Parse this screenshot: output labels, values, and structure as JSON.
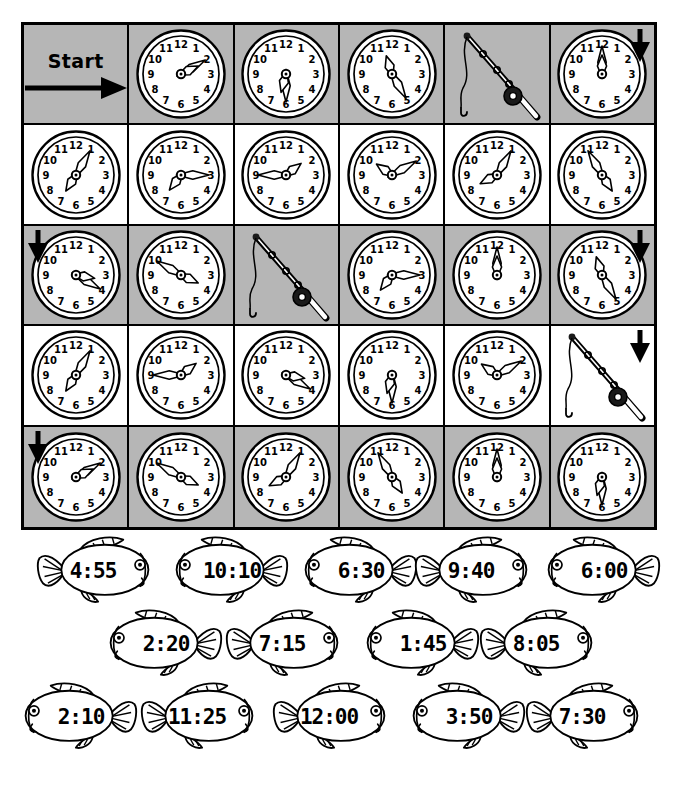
{
  "worksheet": {
    "type": "telling-time maze worksheet",
    "start_label": "Start",
    "grid": {
      "rows": 5,
      "columns": 6,
      "shaded_rows": [
        1,
        3,
        5
      ],
      "cells": [
        [
          {
            "kind": "start",
            "label": "Start",
            "arrow": "right"
          },
          {
            "kind": "clock",
            "time": "2:10",
            "hour": 2,
            "minute": 10
          },
          {
            "kind": "clock",
            "time": "6:30",
            "hour": 6,
            "minute": 30
          },
          {
            "kind": "clock",
            "time": "11:25",
            "hour": 11,
            "minute": 25
          },
          {
            "kind": "rod",
            "label": "fishing-rod"
          },
          {
            "kind": "clock",
            "time": "12:00",
            "hour": 12,
            "minute": 0,
            "arrow": "down-right"
          }
        ],
        [
          {
            "kind": "clock",
            "time": "7:05",
            "hour": 7,
            "minute": 5
          },
          {
            "kind": "clock",
            "time": "7:15",
            "hour": 7,
            "minute": 15
          },
          {
            "kind": "clock",
            "time": "1:45",
            "hour": 1,
            "minute": 45
          },
          {
            "kind": "clock",
            "time": "10:10",
            "hour": 10,
            "minute": 10
          },
          {
            "kind": "clock",
            "time": "8:05",
            "hour": 8,
            "minute": 5
          },
          {
            "kind": "clock",
            "time": "4:55",
            "hour": 4,
            "minute": 55
          }
        ],
        [
          {
            "kind": "clock",
            "time": "3:20",
            "hour": 3,
            "minute": 20,
            "arrow": "down-left"
          },
          {
            "kind": "clock",
            "time": "3:50",
            "hour": 3,
            "minute": 50
          },
          {
            "kind": "rod",
            "label": "fishing-rod"
          },
          {
            "kind": "clock",
            "time": "7:15",
            "hour": 7,
            "minute": 15
          },
          {
            "kind": "clock",
            "time": "12:00",
            "hour": 12,
            "minute": 0
          },
          {
            "kind": "clock",
            "time": "11:25",
            "hour": 11,
            "minute": 25,
            "arrow": "down-right"
          }
        ],
        [
          {
            "kind": "clock",
            "time": "7:05",
            "hour": 7,
            "minute": 5
          },
          {
            "kind": "clock",
            "time": "1:45",
            "hour": 1,
            "minute": 45
          },
          {
            "kind": "clock",
            "time": "3:20",
            "hour": 3,
            "minute": 20
          },
          {
            "kind": "clock",
            "time": "6:30",
            "hour": 6,
            "minute": 30
          },
          {
            "kind": "clock",
            "time": "10:10",
            "hour": 10,
            "minute": 10
          },
          {
            "kind": "rod",
            "label": "fishing-rod",
            "arrow": "down-right"
          }
        ],
        [
          {
            "kind": "clock",
            "time": "2:10",
            "hour": 2,
            "minute": 10,
            "arrow": "down-left"
          },
          {
            "kind": "clock",
            "time": "3:50",
            "hour": 3,
            "minute": 50
          },
          {
            "kind": "clock",
            "time": "8:05",
            "hour": 8,
            "minute": 5
          },
          {
            "kind": "clock",
            "time": "4:55",
            "hour": 4,
            "minute": 55
          },
          {
            "kind": "clock",
            "time": "12:00",
            "hour": 12,
            "minute": 0
          },
          {
            "kind": "clock",
            "time": "6:30",
            "hour": 6,
            "minute": 30
          }
        ]
      ],
      "clock_numerals": [
        "12",
        "1",
        "2",
        "3",
        "4",
        "5",
        "6",
        "7",
        "8",
        "9",
        "10",
        "11"
      ]
    },
    "fish_rows": [
      [
        {
          "time": "4:55",
          "facing": "right",
          "x": 36,
          "w": 126
        },
        {
          "time": "10:10",
          "facing": "left",
          "x": 163,
          "w": 126
        },
        {
          "time": "6:30",
          "facing": "left",
          "x": 292,
          "w": 126
        },
        {
          "time": "9:40",
          "facing": "right",
          "x": 414,
          "w": 126
        },
        {
          "time": "6:00",
          "facing": "left",
          "x": 535,
          "w": 126
        }
      ],
      [
        {
          "time": "2:20",
          "facing": "left",
          "x": 97,
          "w": 126
        },
        {
          "time": "7:15",
          "facing": "right",
          "x": 225,
          "w": 126
        },
        {
          "time": "1:45",
          "facing": "left",
          "x": 354,
          "w": 126
        },
        {
          "time": "8:05",
          "facing": "right",
          "x": 479,
          "w": 126
        }
      ],
      [
        {
          "time": "2:10",
          "facing": "left",
          "x": 12,
          "w": 126
        },
        {
          "time": "11:25",
          "facing": "right",
          "x": 140,
          "w": 126
        },
        {
          "time": "12:00",
          "facing": "right",
          "x": 272,
          "w": 126
        },
        {
          "time": "3:50",
          "facing": "left",
          "x": 400,
          "w": 126
        },
        {
          "time": "7:30",
          "facing": "right",
          "x": 525,
          "w": 126
        }
      ]
    ],
    "colors": {
      "ink": "#000000",
      "shaded_cell": "#b6b6b6",
      "paper": "#ffffff"
    }
  }
}
